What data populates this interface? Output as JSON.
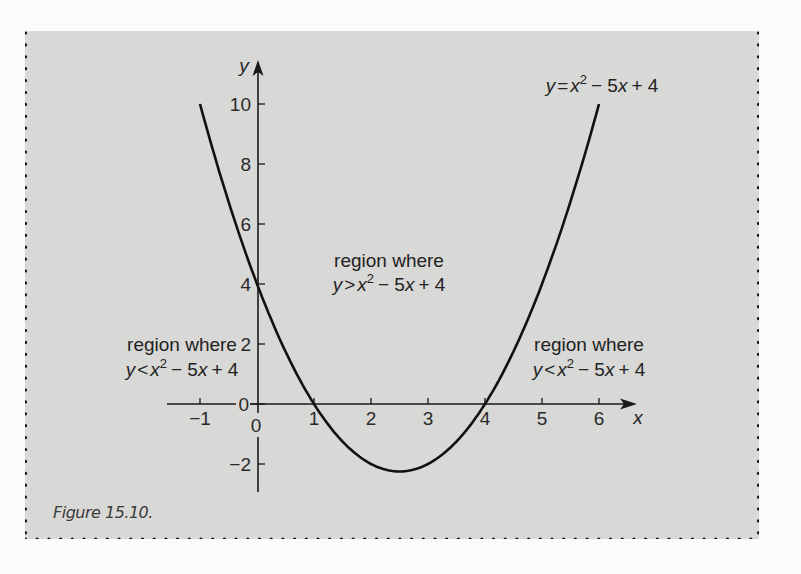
{
  "figure": {
    "caption": "Figure 15.10.",
    "background_color": "#d8d8d7",
    "border_style": "dotted",
    "border_color": "#111111"
  },
  "chart_data": {
    "type": "line",
    "title": "",
    "function": "y = x^2 - 5x + 4",
    "xlabel": "x",
    "ylabel": "y",
    "xlim": [
      -1.6,
      6.7
    ],
    "ylim": [
      -3,
      11.5
    ],
    "x_ticks": [
      -1,
      0,
      1,
      2,
      3,
      4,
      5,
      6
    ],
    "x_tick_labels": [
      "−1",
      "0",
      "1",
      "2",
      "3",
      "4",
      "5",
      "6"
    ],
    "y_ticks": [
      -2,
      0,
      2,
      4,
      6,
      8,
      10
    ],
    "y_tick_labels": [
      "−2",
      "0",
      "2",
      "4",
      "6",
      "8",
      "10"
    ],
    "grid": false,
    "series": [
      {
        "name": "y = x² − 5x + 4",
        "x": [
          -1,
          -0.5,
          0,
          0.5,
          1,
          1.5,
          2,
          2.5,
          3,
          3.5,
          4,
          4.5,
          5,
          5.5,
          6
        ],
        "y": [
          10,
          6.75,
          4,
          1.75,
          0,
          -1.25,
          -2,
          -2.25,
          -2,
          -1.25,
          0,
          1.75,
          4,
          6.75,
          10
        ]
      }
    ],
    "roots": [
      1,
      4
    ],
    "y_intercept": 4,
    "vertex": [
      2.5,
      -2.25
    ],
    "annotations": [
      {
        "name": "curve-label",
        "lines": [
          "y = x² − 5x + 4"
        ]
      },
      {
        "name": "region-above",
        "lines": [
          "region where",
          "y > x² − 5x + 4"
        ]
      },
      {
        "name": "region-below-left",
        "lines": [
          "region where",
          "y < x² − 5x + 4"
        ]
      },
      {
        "name": "region-below-right",
        "lines": [
          "region where",
          "y < x² − 5x + 4"
        ]
      }
    ]
  },
  "labels": {
    "curve": {
      "y": "y",
      "eq": "=",
      "x": "x",
      "sup": "2",
      "rest": "− 5",
      "x2": "x",
      "tail": "+ 4"
    },
    "region_text": "region where",
    "above": {
      "y": "y",
      "op": ">",
      "x": "x",
      "sup": "2",
      "rest": "− 5",
      "x2": "x",
      "tail": "+ 4"
    },
    "below": {
      "y": "y",
      "op": "<",
      "x": "x",
      "sup": "2",
      "rest": "− 5",
      "x2": "x",
      "tail": "+ 4"
    }
  }
}
